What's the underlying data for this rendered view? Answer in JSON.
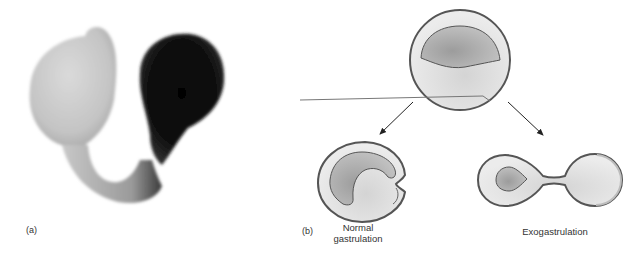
{
  "panel_a": {
    "label": "(a)",
    "description": "Photograph of exogastrulated embryo"
  },
  "panel_b": {
    "label": "(b)",
    "top": "Blastula",
    "left_caption_line1": "Normal",
    "left_caption_line2": "gastrulation",
    "right_caption": "Exogastrulation"
  },
  "colors": {
    "outline": "#555555",
    "fill_light": "#e6e6e6",
    "fill_dark": "#a8a8a8",
    "photo_dark": "#111111",
    "photo_light": "#d0d0d0"
  }
}
